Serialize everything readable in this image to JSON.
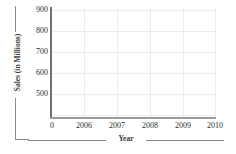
{
  "chart_data": {
    "type": "line",
    "title": "",
    "subtitle": "",
    "xlabel": "Year",
    "ylabel": "Sales (in Millions)",
    "x_tick_labels": [
      "0",
      "2006",
      "2007",
      "2008",
      "2009",
      "2010"
    ],
    "y_tick_labels": [
      "900",
      "800",
      "700",
      "600",
      "500"
    ],
    "y_tick_values": [
      900,
      800,
      700,
      600,
      500
    ],
    "ylim": [
      450,
      900
    ],
    "xlim": [
      2005,
      2010
    ],
    "grid": true,
    "legend": null,
    "legend_position": "none",
    "series": [],
    "values": [],
    "annotations": [],
    "note": "Blank plotting grid with no data series drawn"
  },
  "axes": {
    "y": {
      "title": "Sales (in Millions)",
      "ticks": [
        {
          "label": "900",
          "top_px": 5
        },
        {
          "label": "800",
          "top_px": 26
        },
        {
          "label": "700",
          "top_px": 47
        },
        {
          "label": "600",
          "top_px": 68
        },
        {
          "label": "500",
          "top_px": 89
        }
      ]
    },
    "x": {
      "title": "Year",
      "ticks": [
        {
          "label": "0",
          "left_px": 52
        },
        {
          "label": "2006",
          "left_px": 84
        },
        {
          "label": "2007",
          "left_px": 117
        },
        {
          "label": "2008",
          "left_px": 150
        },
        {
          "label": "2009",
          "left_px": 183
        },
        {
          "label": "2010",
          "left_px": 215
        }
      ]
    }
  },
  "gridlines": {
    "horizontal_tops_px": [
      2,
      23,
      44,
      65,
      86,
      107
    ],
    "vertical_lefts_px": [
      33,
      66,
      99,
      132,
      164
    ]
  },
  "colors": {
    "background": "#ffffff",
    "grid": "#ececec",
    "y_axis_spine": "#6f6f6f",
    "x_axis_spine": "#9a9a9a",
    "rule": "#8a8a8a",
    "tick_text": "#2e2e2e",
    "title_text": "#3b3b3b"
  }
}
